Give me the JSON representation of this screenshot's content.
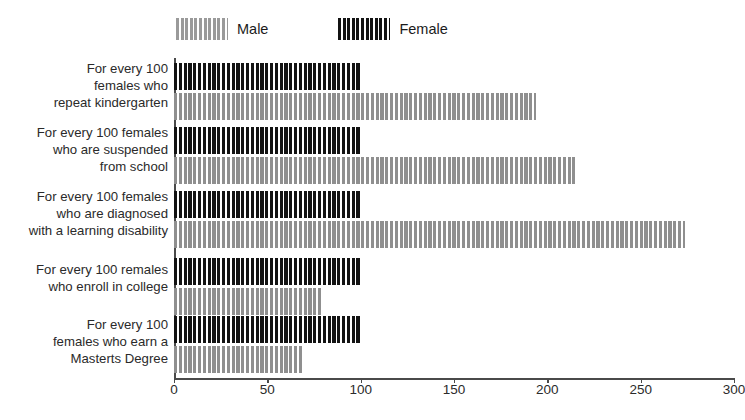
{
  "legend": {
    "position": "top-left",
    "entries": [
      {
        "label": "Male",
        "color": "#8f8f8f",
        "swatch": "striped-gray-swatch"
      },
      {
        "label": "Female",
        "color": "#131313",
        "swatch": "striped-black-swatch"
      }
    ]
  },
  "chart_data": {
    "type": "bar",
    "orientation": "horizontal",
    "title": "",
    "subtitle": "",
    "xlabel": "",
    "ylabel": "",
    "xlim": [
      0,
      300
    ],
    "xticks": [
      0,
      50,
      100,
      150,
      200,
      250,
      300
    ],
    "xtick_labels": [
      "0",
      "50",
      "100",
      "150",
      "200",
      "250",
      "300"
    ],
    "grid": false,
    "legend_position": "top-left",
    "categories": [
      "For every 100\nfemales who\nrepeat kindergarten",
      "For every 100 females\nwho are suspended\nfrom school",
      "For every 100 females\nwho are diagnosed\nwith a learning disability",
      "For every 100 remales\nwho enroll in college",
      "For every 100\nfemales who earn a\nMasterts Degree"
    ],
    "category_lines": [
      [
        "For every 100",
        "females who",
        "repeat kindergarten"
      ],
      [
        "For every 100 females",
        "who are suspended",
        "from school"
      ],
      [
        "For every 100 females",
        "who are diagnosed",
        "with a learning disability"
      ],
      [
        "For every 100 remales",
        "who enroll in college"
      ],
      [
        "For every 100",
        "females who earn a",
        "Masterts Degree"
      ]
    ],
    "series": [
      {
        "name": "Female",
        "color": "#131313",
        "values": [
          100,
          100,
          100,
          100,
          100
        ]
      },
      {
        "name": "Male",
        "color": "#8f8f8f",
        "values": [
          194,
          215,
          274,
          79,
          69
        ]
      }
    ]
  },
  "axis": {
    "line_color": "#4a4a4a"
  }
}
